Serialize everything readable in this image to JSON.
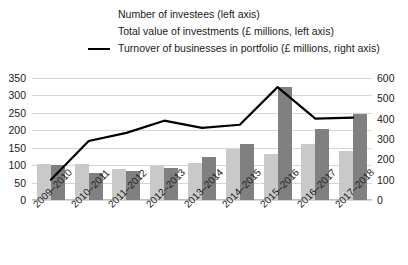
{
  "legend": {
    "items": [
      {
        "label": "Number of investees (left axis)",
        "marker": "swatch",
        "color": "#c9c9c9"
      },
      {
        "label": "Total value of investments (£ millions, left axis)",
        "marker": "swatch",
        "color": "#808080"
      },
      {
        "label": "Turnover of businesses in portfolio (£ millions, right axis)",
        "marker": "line",
        "color": "#000000"
      }
    ]
  },
  "axes": {
    "left_ticks": [
      "350",
      "300",
      "250",
      "200",
      "150",
      "100",
      "50",
      "0"
    ],
    "right_ticks": [
      "600",
      "500",
      "400",
      "300",
      "200",
      "100",
      "0"
    ],
    "left_range": [
      0,
      350
    ],
    "right_range": [
      0,
      600
    ],
    "grid": true
  },
  "chart_data": {
    "type": "bar",
    "title": "",
    "xlabel": "",
    "ylabel": "",
    "ylim": [
      0,
      350
    ],
    "y2lim": [
      0,
      600
    ],
    "grid": true,
    "legend_position": "top",
    "categories": [
      "2009–2010",
      "2010–2011",
      "2011–2012",
      "2012–2013",
      "2013–2014",
      "2014–2015",
      "2015–2016",
      "2016–2017",
      "2017–2018"
    ],
    "series": [
      {
        "name": "Number of investees (left axis)",
        "type": "bar",
        "axis": "left",
        "color": "#c9c9c9",
        "values": [
          103,
          104,
          88,
          98,
          107,
          145,
          131,
          160,
          140
        ]
      },
      {
        "name": "Total value of investments (£ millions, left axis)",
        "type": "bar",
        "axis": "left",
        "color": "#808080",
        "values": [
          100,
          78,
          82,
          92,
          123,
          160,
          325,
          205,
          248
        ]
      },
      {
        "name": "Turnover of businesses in portfolio (£ millions, right axis)",
        "type": "line",
        "axis": "right",
        "color": "#000000",
        "values": [
          100,
          290,
          330,
          390,
          355,
          370,
          555,
          400,
          405
        ]
      }
    ]
  }
}
